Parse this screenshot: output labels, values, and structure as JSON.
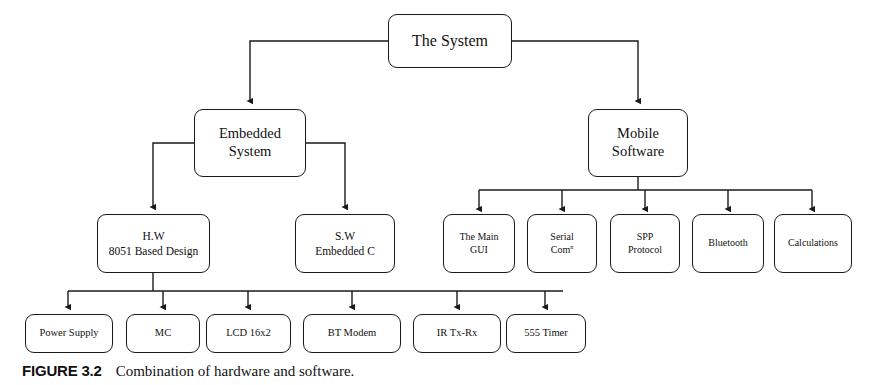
{
  "figure": {
    "label": "FIGURE 3.2",
    "caption": "Combination of hardware and software."
  },
  "diagram": {
    "type": "block-hierarchy",
    "root": {
      "id": "the-system",
      "title": "The System",
      "lines": [
        "The System"
      ]
    },
    "level1": [
      {
        "id": "embedded-system",
        "lines": [
          "Embedded",
          "System"
        ]
      },
      {
        "id": "mobile-software",
        "lines": [
          "Mobile",
          "Software"
        ]
      }
    ],
    "level2_embedded": [
      {
        "id": "hw-8051",
        "lines": [
          "H.W",
          "8051 Based Design"
        ]
      },
      {
        "id": "sw-embedded-c",
        "lines": [
          "S.W",
          "Embedded C"
        ]
      }
    ],
    "level2_mobile": [
      {
        "id": "the-main-gui",
        "lines": [
          "The Main",
          "GUI"
        ]
      },
      {
        "id": "serial-comn",
        "lines": [
          "Serial",
          "Com"
        ],
        "superscript": "n"
      },
      {
        "id": "spp-protocol",
        "lines": [
          "SPP",
          "Protocol"
        ]
      },
      {
        "id": "bluetooth",
        "lines": [
          "Bluetooth"
        ]
      },
      {
        "id": "calculations",
        "lines": [
          "Calculations"
        ]
      }
    ],
    "level3_hardware": [
      {
        "id": "power-supply",
        "lines": [
          "Power Supply"
        ]
      },
      {
        "id": "mc",
        "lines": [
          "MC"
        ]
      },
      {
        "id": "lcd-16x2",
        "lines": [
          "LCD 16x2"
        ]
      },
      {
        "id": "bt-modem",
        "lines": [
          "BT Modem"
        ]
      },
      {
        "id": "ir-tx-rx",
        "lines": [
          "IR Tx-Rx"
        ]
      },
      {
        "id": "555-timer",
        "lines": [
          "555 Timer"
        ]
      }
    ],
    "colors": {
      "line": "#1a1a1a",
      "box_fill": "#ffffff",
      "text": "#111111"
    }
  }
}
